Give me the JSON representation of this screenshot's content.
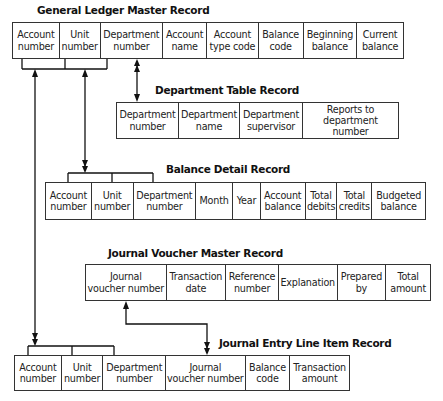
{
  "records": {
    "general_ledger": {
      "title": "General Ledger Master Record",
      "fields": [
        "Account\nnumber",
        "Unit\nnumber",
        "Department\nnumber",
        "Account\nname",
        "Account\ntype code",
        "Balance\ncode",
        "Beginning\nbalance",
        "Current\nbalance"
      ]
    },
    "department_table": {
      "title": "Department Table Record",
      "fields": [
        "Department\nnumber",
        "Department\nname",
        "Department\nsupervisor",
        "Reports to\ndepartment number"
      ]
    },
    "balance_detail": {
      "title": "Balance Detail Record",
      "fields": [
        "Account\nnumber",
        "Unit\nnumber",
        "Department\nnumber",
        "Month",
        "Year",
        "Account\nbalance",
        "Total\ndebits",
        "Total\ncredits",
        "Budgeted\nbalance"
      ]
    },
    "journal_voucher": {
      "title": "Journal Voucher Master Record",
      "fields": [
        "Journal\nvoucher number",
        "Transaction\ndate",
        "Reference\nnumber",
        "Explanation",
        "Prepared\nby",
        "Total\namount"
      ]
    },
    "journal_entry": {
      "title": "Journal Entry Line Item Record",
      "fields": [
        "Account\nnumber",
        "Unit\nnumber",
        "Department\nnumber",
        "Journal\nvoucher number",
        "Balance\ncode",
        "Transaction\namount"
      ]
    }
  },
  "relationships": [
    {
      "from": "General Ledger Master Record",
      "to": "Department Table Record",
      "key": "Department number"
    },
    {
      "from": "General Ledger Master Record",
      "to": "Balance Detail Record",
      "key": "Account number + Unit number + Department number"
    },
    {
      "from": "General Ledger Master Record",
      "to": "Journal Entry Line Item Record",
      "key": "Account number + Unit number + Department number"
    },
    {
      "from": "Journal Voucher Master Record",
      "to": "Journal Entry Line Item Record",
      "key": "Journal voucher number"
    }
  ]
}
